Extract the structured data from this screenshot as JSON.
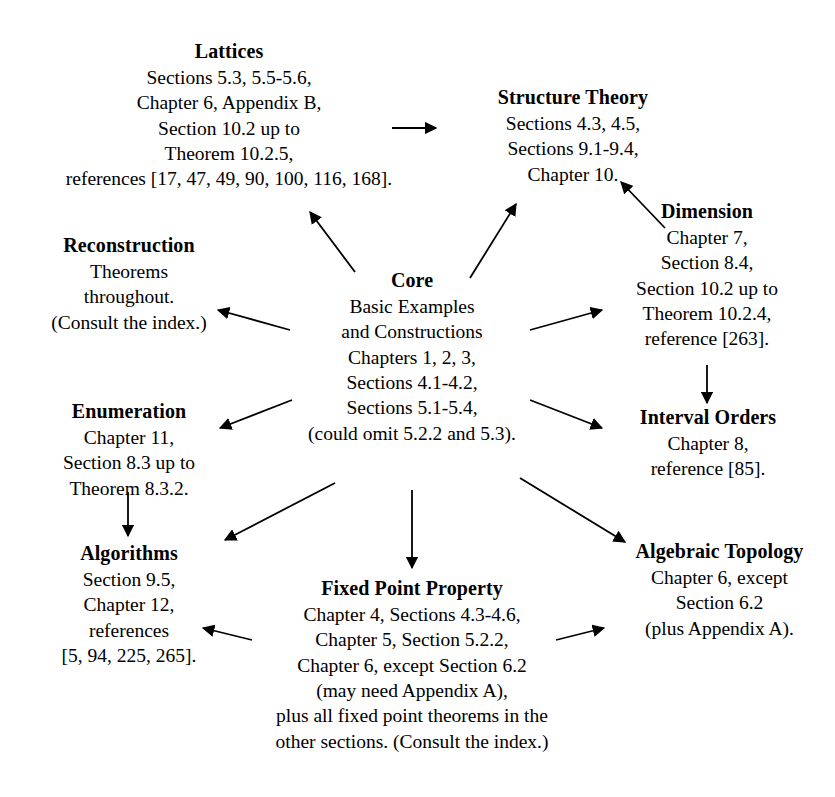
{
  "diagram": {
    "ink_color": "#000000",
    "background_color": "#ffffff",
    "nodes": [
      {
        "id": "lattices",
        "title": "Lattices",
        "lines": [
          "Sections 5.3, 5.5-5.6,",
          "Chapter 6, Appendix B,",
          "Section 10.2 up to",
          "Theorem 10.2.5,",
          "references [17, 47, 49, 90, 100, 116, 168]."
        ]
      },
      {
        "id": "structure-theory",
        "title": "Structure Theory",
        "lines": [
          "Sections 4.3, 4.5,",
          "Sections 9.1-9.4,",
          "Chapter 10."
        ]
      },
      {
        "id": "dimension",
        "title": "Dimension",
        "lines": [
          "Chapter 7,",
          "Section 8.4,",
          "Section 10.2 up to",
          "Theorem 10.2.4,",
          "reference [263]."
        ]
      },
      {
        "id": "reconstruction",
        "title": "Reconstruction",
        "lines": [
          "Theorems",
          "throughout.",
          "(Consult the index.)"
        ]
      },
      {
        "id": "core",
        "title": "Core",
        "lines": [
          "Basic Examples",
          "and Constructions",
          "Chapters 1, 2, 3,",
          "Sections 4.1-4.2,",
          "Sections 5.1-5.4,",
          "(could omit 5.2.2 and 5.3)."
        ]
      },
      {
        "id": "interval-orders",
        "title": "Interval Orders",
        "lines": [
          "Chapter 8,",
          "reference [85]."
        ]
      },
      {
        "id": "enumeration",
        "title": "Enumeration",
        "lines": [
          "Chapter 11,",
          "Section 8.3 up to",
          "Theorem 8.3.2."
        ]
      },
      {
        "id": "algorithms",
        "title": "Algorithms",
        "lines": [
          "Section 9.5,",
          "Chapter 12,",
          "references",
          "[5, 94, 225, 265]."
        ]
      },
      {
        "id": "fixed-point-property",
        "title": "Fixed Point Property",
        "lines": [
          "Chapter 4, Sections 4.3-4.6,",
          "Chapter 5, Section 5.2.2,",
          "Chapter 6, except Section 6.2",
          "(may need Appendix A),",
          "plus all fixed point theorems in the",
          "other sections. (Consult the index.)"
        ]
      },
      {
        "id": "algebraic-topology",
        "title": "Algebraic Topology",
        "lines": [
          "Chapter 6, except",
          "Section 6.2",
          "(plus Appendix A)."
        ]
      }
    ],
    "edges": [
      {
        "id": "lattices-to-structure-theory",
        "from": "lattices",
        "to": "structure-theory"
      },
      {
        "id": "core-to-lattices",
        "from": "core",
        "to": "lattices"
      },
      {
        "id": "core-to-structure-theory",
        "from": "core",
        "to": "structure-theory"
      },
      {
        "id": "dimension-to-structure-theory",
        "from": "dimension",
        "to": "structure-theory"
      },
      {
        "id": "core-to-reconstruction",
        "from": "core",
        "to": "reconstruction"
      },
      {
        "id": "core-to-dimension",
        "from": "core",
        "to": "dimension"
      },
      {
        "id": "dimension-to-interval-orders",
        "from": "dimension",
        "to": "interval-orders"
      },
      {
        "id": "core-to-enumeration",
        "from": "core",
        "to": "enumeration"
      },
      {
        "id": "core-to-interval-orders",
        "from": "core",
        "to": "interval-orders"
      },
      {
        "id": "enumeration-to-algorithms",
        "from": "enumeration",
        "to": "algorithms"
      },
      {
        "id": "core-to-algorithms",
        "from": "core",
        "to": "algorithms"
      },
      {
        "id": "core-to-fixed-point-property",
        "from": "core",
        "to": "fixed-point-property"
      },
      {
        "id": "core-to-algebraic-topology",
        "from": "core",
        "to": "algebraic-topology"
      },
      {
        "id": "fixed-point-property-to-algorithms",
        "from": "fixed-point-property",
        "to": "algorithms"
      },
      {
        "id": "fixed-point-property-to-algebraic-topology",
        "from": "fixed-point-property",
        "to": "algebraic-topology"
      }
    ]
  }
}
